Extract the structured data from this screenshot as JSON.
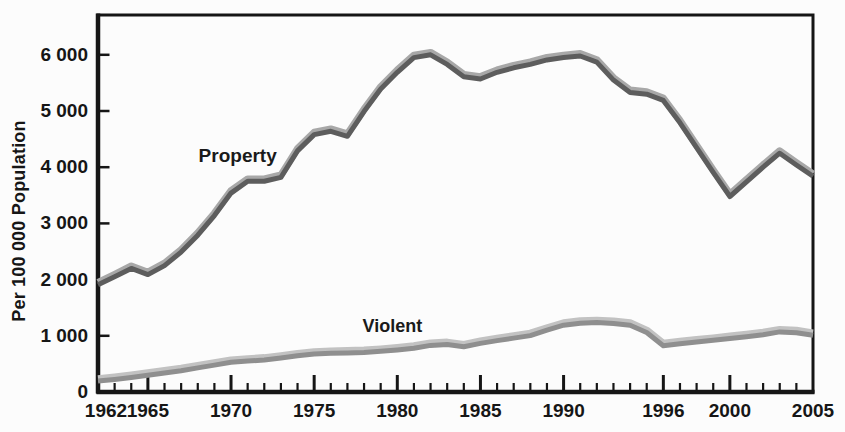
{
  "chart_data": {
    "type": "line",
    "title": "",
    "xlabel": "",
    "ylabel": "Per 100 000 Population",
    "grid": false,
    "legend_position": "inline-labels-on-lines",
    "xlim": [
      1962,
      2005
    ],
    "ylim": [
      0,
      6700
    ],
    "x": [
      1962,
      1963,
      1964,
      1965,
      1966,
      1967,
      1968,
      1969,
      1970,
      1971,
      1972,
      1973,
      1974,
      1975,
      1976,
      1977,
      1978,
      1979,
      1980,
      1981,
      1982,
      1983,
      1984,
      1985,
      1986,
      1987,
      1988,
      1989,
      1990,
      1991,
      1992,
      1993,
      1994,
      1995,
      1996,
      1997,
      1998,
      1999,
      2000,
      2001,
      2002,
      2003,
      2004,
      2005
    ],
    "series": [
      {
        "name": "Property",
        "color": "#5d5d5d",
        "highlight_color": "#a8a8a8",
        "values": [
          1920,
          2060,
          2210,
          2100,
          2260,
          2500,
          2800,
          3150,
          3550,
          3760,
          3760,
          3830,
          4300,
          4590,
          4650,
          4560,
          5000,
          5400,
          5700,
          5960,
          6010,
          5840,
          5620,
          5580,
          5700,
          5780,
          5840,
          5920,
          5960,
          5990,
          5880,
          5560,
          5340,
          5310,
          5200,
          4800,
          4360,
          3920,
          3490,
          3750,
          4010,
          4260,
          4050,
          3850
        ]
      },
      {
        "name": "Violent",
        "color": "#8f8f8f",
        "highlight_color": "#c2c2c2",
        "values": [
          205,
          235,
          270,
          310,
          350,
          390,
          440,
          490,
          540,
          560,
          580,
          615,
          655,
          685,
          700,
          705,
          715,
          735,
          760,
          790,
          840,
          855,
          815,
          875,
          925,
          970,
          1015,
          1110,
          1200,
          1235,
          1245,
          1230,
          1200,
          1070,
          835,
          870,
          900,
          930,
          965,
          995,
          1030,
          1080,
          1065,
          1020
        ]
      }
    ],
    "xticks_labeled": [
      1962,
      1965,
      1970,
      1975,
      1980,
      1985,
      1990,
      1996,
      2000,
      2005
    ],
    "xticks_minor_every_year": true,
    "yticks": [
      {
        "value": 0,
        "label": "0"
      },
      {
        "value": 1000,
        "label": "1 000"
      },
      {
        "value": 2000,
        "label": "2 000"
      },
      {
        "value": 3000,
        "label": "3 000"
      },
      {
        "value": 4000,
        "label": "4 000"
      },
      {
        "value": 5000,
        "label": "5 000"
      },
      {
        "value": 6000,
        "label": "6 000"
      }
    ],
    "annotations": [
      {
        "text": "Property",
        "x": 1970.4,
        "y": 4200,
        "series": "Property"
      },
      {
        "text": "Violent",
        "x": 1979.7,
        "y": 1175,
        "series": "Violent"
      }
    ],
    "axis_color": "#161616",
    "background_color": "#fcfcfc"
  }
}
